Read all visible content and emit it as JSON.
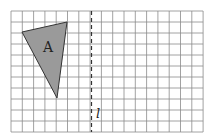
{
  "figure": {
    "width": 214,
    "height": 138,
    "background": "#ffffff",
    "grid": {
      "columns": 17,
      "rows": 11,
      "origin_x": 11,
      "origin_y": 11,
      "cell_w": 11.3,
      "cell_h": 11.0,
      "line_color": "#8a8a8a"
    },
    "shape": {
      "name": "triangle-A",
      "label": "A",
      "fill": "#9a9a9a",
      "stroke": "#333333",
      "vertices": [
        [
          22,
          32
        ],
        [
          67,
          22
        ],
        [
          57,
          98
        ]
      ],
      "label_pos": [
        48,
        52
      ]
    },
    "mirror_line": {
      "label": "l",
      "x": 91.5,
      "y1": 11,
      "y2": 132,
      "color": "#333333",
      "label_pos": [
        96,
        118
      ]
    }
  }
}
